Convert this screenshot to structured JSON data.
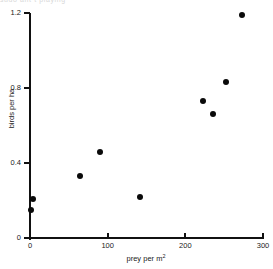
{
  "figure": {
    "background_color": "#ffffff",
    "marker_color": "#0a0a0a",
    "axis_color": "#111111",
    "top_cropped_text": "sudo ant t piaying"
  },
  "chart_data": {
    "type": "scatter",
    "title": "",
    "subtitle": "",
    "xlabel": "prey per m",
    "xlabel_superscript": "2",
    "ylabel": "birds per ha",
    "xlim": [
      0,
      300
    ],
    "ylim": [
      0,
      1.2
    ],
    "xticks": [
      0,
      100,
      200,
      300
    ],
    "yticks": [
      0,
      0.4,
      0.8,
      1.2
    ],
    "xticklabels": [
      "0",
      "100",
      "200",
      "300"
    ],
    "yticklabels": [
      "0",
      "0.4",
      "0.8",
      "1.2"
    ],
    "grid": false,
    "legend": null,
    "legend_position": "none",
    "series": [
      {
        "name": "observations",
        "marker": "filled-circle",
        "color": "#0a0a0a",
        "points": [
          {
            "x": 1,
            "y": 0.15
          },
          {
            "x": 4,
            "y": 0.21
          },
          {
            "x": 64,
            "y": 0.33
          },
          {
            "x": 90,
            "y": 0.46
          },
          {
            "x": 141,
            "y": 0.22
          },
          {
            "x": 223,
            "y": 0.73
          },
          {
            "x": 235,
            "y": 0.66
          },
          {
            "x": 253,
            "y": 0.83
          },
          {
            "x": 273,
            "y": 1.19
          }
        ]
      }
    ]
  }
}
